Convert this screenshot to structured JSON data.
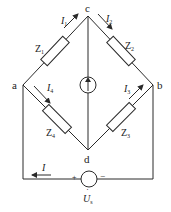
{
  "diagram": {
    "type": "bridge-circuit",
    "nodes": {
      "a": {
        "label": "a"
      },
      "b": {
        "label": "b"
      },
      "c": {
        "label": "c"
      },
      "d": {
        "label": "d"
      }
    },
    "impedances": [
      {
        "id": "Z1",
        "main": "Z",
        "sub": "1",
        "branch": "a-c"
      },
      {
        "id": "Z2",
        "main": "Z",
        "sub": "2",
        "branch": "c-b"
      },
      {
        "id": "Z3",
        "main": "Z",
        "sub": "3",
        "branch": "d-b"
      },
      {
        "id": "Z4",
        "main": "Z",
        "sub": "4",
        "branch": "a-d"
      }
    ],
    "currents": [
      {
        "id": "I1",
        "main": "I",
        "sub": "1",
        "direction": "a to c"
      },
      {
        "id": "I2",
        "main": "I",
        "sub": "2",
        "direction": "c to b"
      },
      {
        "id": "I3",
        "main": "I",
        "sub": "3",
        "direction": "d to b"
      },
      {
        "id": "I4",
        "main": "I",
        "sub": "4",
        "direction": "a to d"
      },
      {
        "id": "I",
        "main": "I",
        "sub": "",
        "direction": "right to left along bottom wire"
      }
    ],
    "current_source": {
      "branch": "d-c",
      "direction": "up"
    },
    "voltage_source": {
      "main": "U",
      "sub": "s",
      "dot": "·",
      "plus": "+",
      "minus": "−"
    }
  }
}
